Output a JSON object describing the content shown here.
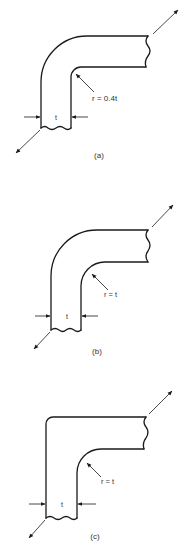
{
  "figure": {
    "panels": [
      {
        "id": "a",
        "caption": "(a)",
        "radius_label": "r = 0.4t",
        "thickness_label": "t",
        "corner": "small inner radius, large outer radius"
      },
      {
        "id": "b",
        "caption": "(b)",
        "radius_label": "r = t",
        "thickness_label": "t",
        "corner": "inner radius equals thickness, large outer radius"
      },
      {
        "id": "c",
        "caption": "(c)",
        "radius_label": "r = t",
        "thickness_label": "t",
        "corner": "inner radius equals thickness, sharp outer corner"
      }
    ],
    "colors": {
      "line": "#1a1a1a",
      "text": "#333333",
      "background": "#ffffff"
    }
  }
}
